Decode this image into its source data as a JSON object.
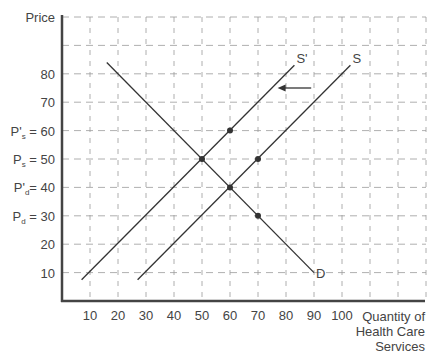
{
  "chart_data": {
    "type": "line",
    "title": "",
    "xlabel": "Quantity of Health Care Services",
    "xlabel_lines": [
      "Quantity of",
      "Health Care",
      "Services"
    ],
    "ylabel": "Price",
    "xlim": [
      0,
      130
    ],
    "ylim": [
      0,
      100
    ],
    "grid": true,
    "grid_style": "dashed",
    "x_ticks": [
      10,
      20,
      30,
      40,
      50,
      60,
      70,
      80,
      90,
      100
    ],
    "x_tick_labels": [
      "10",
      "20",
      "30",
      "40",
      "50",
      "60",
      "70",
      "80",
      "90",
      "100"
    ],
    "y_ticks": [
      {
        "value": 10,
        "label": "10"
      },
      {
        "value": 20,
        "label": "20"
      },
      {
        "value": 30,
        "label": "P",
        "sub": "d",
        "suffix": " = 30"
      },
      {
        "value": 40,
        "label": "P'",
        "sub": "d",
        "suffix": "= 40"
      },
      {
        "value": 50,
        "label": "P",
        "sub": "s",
        "suffix": " = 50"
      },
      {
        "value": 60,
        "label": "P'",
        "sub": "s",
        "suffix": " = 60"
      },
      {
        "value": 70,
        "label": "70"
      },
      {
        "value": 80,
        "label": "80"
      }
    ],
    "series": [
      {
        "name": "D",
        "label": "D",
        "points": [
          [
            16,
            84
          ],
          [
            90,
            10
          ]
        ]
      },
      {
        "name": "S",
        "label": "S",
        "points": [
          [
            27,
            7.5
          ],
          [
            103,
            83
          ]
        ]
      },
      {
        "name": "S'",
        "label": "S'",
        "points": [
          [
            7,
            7.5
          ],
          [
            83,
            83
          ]
        ]
      }
    ],
    "highlight_points": [
      [
        50,
        50
      ],
      [
        60,
        60
      ],
      [
        70,
        50
      ],
      [
        60,
        40
      ],
      [
        70,
        30
      ]
    ],
    "annotations": [
      {
        "type": "arrow",
        "from": [
          89,
          75
        ],
        "to": [
          77,
          75
        ],
        "meaning": "supply shifts left from S to S'"
      }
    ]
  }
}
